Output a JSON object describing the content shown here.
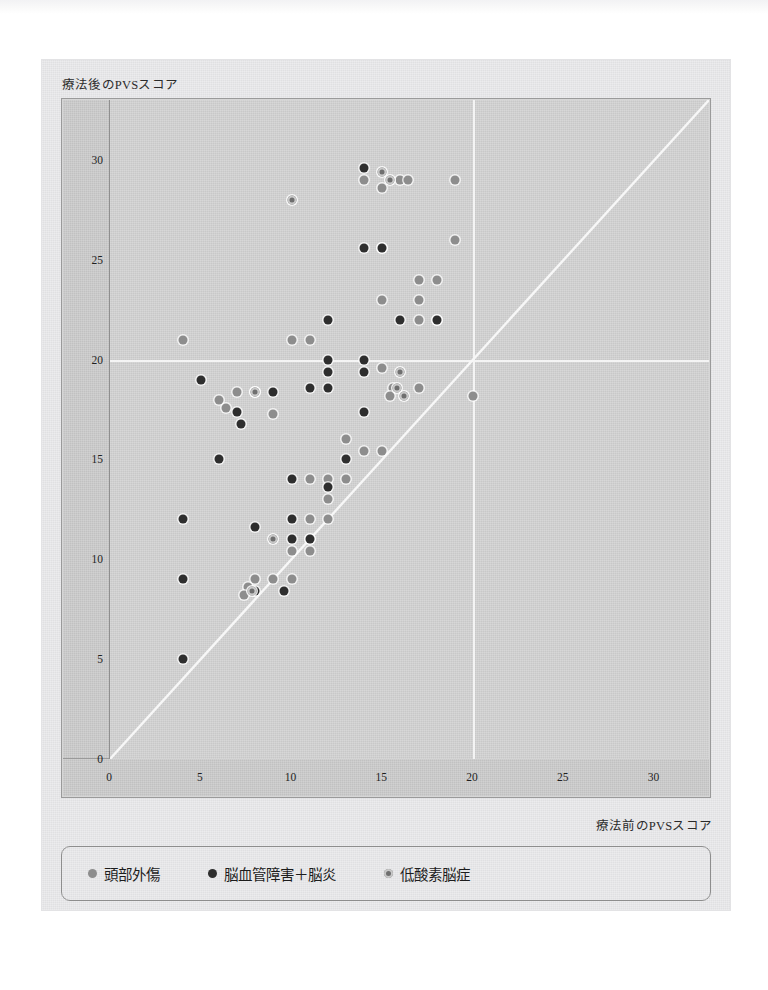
{
  "figure": {
    "y_axis_title": "療法後のPVSスコア",
    "x_axis_title": "療法前のPVSスコア"
  },
  "legend": {
    "items": [
      {
        "label": "頭部外傷",
        "marker": "filled-light-gray-dot",
        "color": "#8d8d8d",
        "key": "head-trauma"
      },
      {
        "label": "脳血管障害＋脳炎",
        "marker": "filled-dark-dot",
        "color": "#2e2e2e",
        "key": "cvd-enceph"
      },
      {
        "label": "低酸素脳症",
        "marker": "ringed-dot",
        "color": "#6f6f6f",
        "key": "hypoxic"
      }
    ]
  },
  "chart_data": {
    "type": "scatter",
    "title": "",
    "xlabel": "療法前のPVSスコア",
    "ylabel": "療法後のPVSスコア",
    "xlim": [
      0,
      33
    ],
    "ylim": [
      0,
      33
    ],
    "xticks": [
      0,
      5,
      10,
      15,
      20,
      25,
      30
    ],
    "yticks": [
      0,
      5,
      10,
      15,
      20,
      25,
      30
    ],
    "grid": "reference lines at x=20 and y=20",
    "reference_lines": [
      {
        "name": "identity-line",
        "type": "diagonal",
        "from": [
          0,
          0
        ],
        "to": [
          33,
          33
        ],
        "color": "#f7f7f7"
      },
      {
        "name": "vertical-20",
        "type": "vertical",
        "value": 20,
        "color": "#f4f4f4"
      },
      {
        "name": "horizontal-20",
        "type": "horizontal",
        "value": 20,
        "color": "#f4f4f4"
      }
    ],
    "legend_position": "below-plot",
    "series": [
      {
        "name": "頭部外傷",
        "key": "head-trauma",
        "color": "#8d8d8d",
        "points": [
          [
            4,
            21
          ],
          [
            6,
            18
          ],
          [
            6.4,
            17.6
          ],
          [
            7,
            18.4
          ],
          [
            8,
            18.4
          ],
          [
            9,
            17.3
          ],
          [
            10,
            21
          ],
          [
            11,
            21
          ],
          [
            11,
            14
          ],
          [
            12,
            14
          ],
          [
            13,
            14
          ],
          [
            12,
            12
          ],
          [
            11,
            11
          ],
          [
            11,
            10.4
          ],
          [
            10,
            10.4
          ],
          [
            10,
            9
          ],
          [
            9,
            9
          ],
          [
            8,
            9
          ],
          [
            7.6,
            8.6
          ],
          [
            7.4,
            8.2
          ],
          [
            14,
            29
          ],
          [
            15,
            28.6
          ],
          [
            16,
            29
          ],
          [
            16.4,
            29
          ],
          [
            19,
            29
          ],
          [
            15,
            25.6
          ],
          [
            17,
            24
          ],
          [
            18,
            24
          ],
          [
            15,
            23
          ],
          [
            17,
            22
          ],
          [
            18,
            22
          ],
          [
            15,
            19.6
          ],
          [
            15.6,
            18.6
          ],
          [
            15.4,
            18.2
          ],
          [
            17,
            18.6
          ],
          [
            20,
            18.2
          ],
          [
            13,
            16
          ],
          [
            14,
            15.4
          ],
          [
            15,
            15.4
          ],
          [
            12,
            13
          ],
          [
            11,
            12
          ],
          [
            19,
            26
          ],
          [
            17,
            23
          ]
        ]
      },
      {
        "name": "脳血管障害＋脳炎",
        "key": "cvd-enceph",
        "color": "#2e2e2e",
        "points": [
          [
            4,
            12
          ],
          [
            4,
            9
          ],
          [
            4,
            5
          ],
          [
            5,
            19
          ],
          [
            7,
            17.4
          ],
          [
            7.2,
            16.8
          ],
          [
            9,
            18.4
          ],
          [
            11,
            18.6
          ],
          [
            12,
            18.6
          ],
          [
            12,
            20
          ],
          [
            12,
            19.4
          ],
          [
            14,
            25.6
          ],
          [
            14,
            29.6
          ],
          [
            15,
            25.6
          ],
          [
            12,
            22
          ],
          [
            16,
            22
          ],
          [
            18,
            22
          ],
          [
            14,
            20
          ],
          [
            14,
            19.4
          ],
          [
            14,
            17.4
          ],
          [
            13,
            15
          ],
          [
            12,
            13.6
          ],
          [
            10,
            12
          ],
          [
            10,
            11
          ],
          [
            11,
            11
          ],
          [
            9.6,
            8.4
          ],
          [
            8,
            8.4
          ],
          [
            6,
            15
          ],
          [
            8,
            11.6
          ],
          [
            10,
            14
          ]
        ]
      },
      {
        "name": "低酸素脳症",
        "key": "hypoxic",
        "color": "#6f6f6f",
        "points": [
          [
            10,
            28
          ],
          [
            15,
            29.4
          ],
          [
            15.4,
            29
          ],
          [
            8,
            18.4
          ],
          [
            15.8,
            18.6
          ],
          [
            16.2,
            18.2
          ],
          [
            9,
            11
          ],
          [
            7.8,
            8.4
          ],
          [
            16,
            19.4
          ]
        ]
      }
    ]
  }
}
